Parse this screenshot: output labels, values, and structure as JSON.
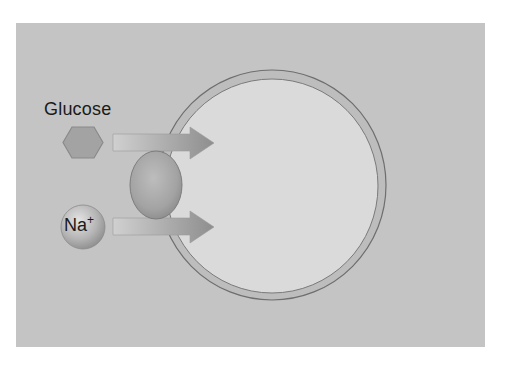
{
  "diagram": {
    "labels": {
      "glucose": "Glucose",
      "sodium_base": "Na",
      "sodium_charge": "+"
    },
    "elements": {
      "extracellular_panel": {
        "color": "#c4c4c4"
      },
      "cell": {
        "membrane_color": "#b9b9b9",
        "membrane_stroke": "#6e6e6e",
        "cytoplasm_color": "#dadada"
      },
      "transporter": {
        "shape": "oval",
        "color": "#a5a5a5"
      },
      "glucose_molecule": {
        "shape": "hexagon",
        "color": "#a3a3a3"
      },
      "sodium_ion": {
        "shape": "sphere",
        "color": "#b0b0b0"
      },
      "arrows": [
        {
          "from": "glucose",
          "direction": "into-cell"
        },
        {
          "from": "sodium",
          "direction": "into-cell"
        }
      ]
    }
  }
}
